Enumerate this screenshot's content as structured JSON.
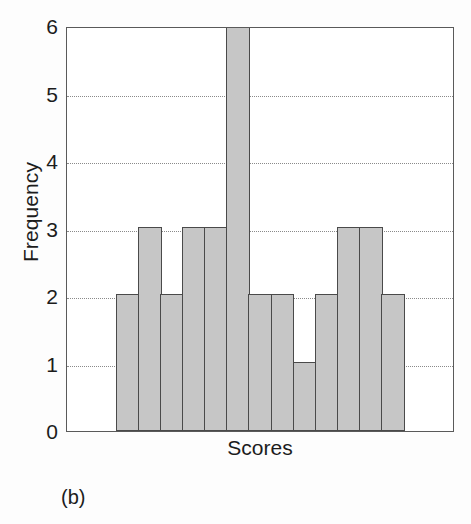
{
  "figure": {
    "caption": "(b)",
    "background_color": "#fdfdfd"
  },
  "chart_data": {
    "type": "bar",
    "title": "",
    "subtitle": "",
    "xlabel": "Scores",
    "ylabel": "Frequency",
    "categories": [
      "1",
      "2",
      "3",
      "4",
      "5",
      "6",
      "7",
      "8",
      "9",
      "10",
      "11",
      "12",
      "13"
    ],
    "values": [
      2,
      3,
      2,
      3,
      3,
      6,
      2,
      2,
      1,
      2,
      3,
      3,
      2
    ],
    "ylim": [
      0,
      6
    ],
    "ytick_labels": [
      "0",
      "1",
      "2",
      "3",
      "4",
      "5",
      "6"
    ],
    "ytick_values": [
      0,
      1,
      2,
      3,
      4,
      5,
      6
    ],
    "xtick_labels": [],
    "grid": "horizontal-dotted",
    "gridline_values": [
      1,
      2,
      3,
      4,
      5
    ],
    "legend": null,
    "legend_position": "none",
    "bar_fill_color": "#c6c6c6",
    "bar_edge_color": "#4a4a4a",
    "axis_color": "#5a5a5a",
    "gridline_color": "#8a8a8a",
    "text_color": "#1c1c1c",
    "annotations": []
  }
}
